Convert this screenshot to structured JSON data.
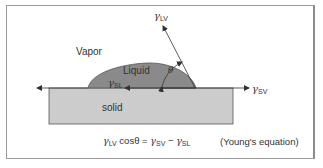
{
  "diagram": {
    "regions": {
      "vapor": "Vapor",
      "liquid": "Liquid",
      "solid": "solid"
    },
    "tensions": {
      "lv": {
        "symbol": "γ",
        "sub": "LV"
      },
      "sv": {
        "symbol": "γ",
        "sub": "SV"
      },
      "sl": {
        "symbol": "γ",
        "sub": "SL"
      }
    },
    "angle_label": "θ",
    "equation": {
      "lhs_symbol": "γ",
      "lhs_sub": "LV",
      "lhs_rest": " cosθ = ",
      "rhs1_symbol": "γ",
      "rhs1_sub": "SV",
      "minus": " − ",
      "rhs2_symbol": "γ",
      "rhs2_sub": "SL",
      "name": "(Young's equation)"
    },
    "colors": {
      "liquid": "#8a8a8a",
      "solid": "#cccccc",
      "lines": "#333333",
      "frame": "#9a9a9a"
    }
  }
}
